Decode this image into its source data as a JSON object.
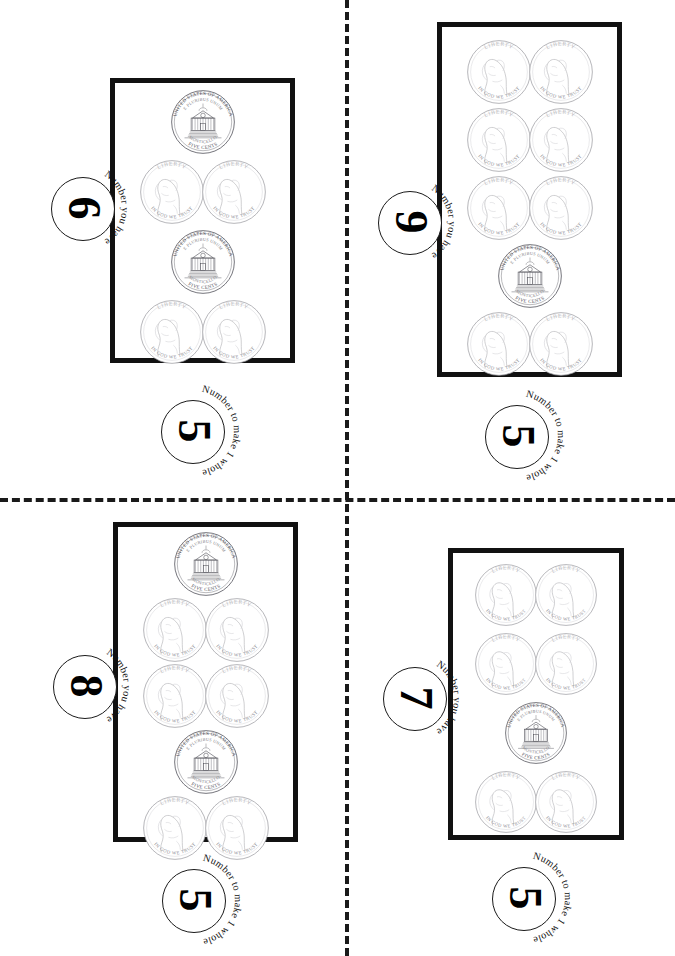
{
  "worksheet": {
    "title": "Coin fraction cards worksheet",
    "page_background": "#ffffff",
    "ink_color": "#111111",
    "cut_lines": {
      "style": "dashed",
      "horizontal_y": 498,
      "vertical_x": 345
    }
  },
  "labels": {
    "have_text": "Number you have",
    "whole_text": "Number to make 1 whole"
  },
  "coin": {
    "type": "nickel",
    "obverse_legend_top": "LIBERTY",
    "obverse_legend_bottom": "IN GOD WE TRUST",
    "reverse_legend_top": "UNITED STATES OF AMERICA",
    "reverse_legend_bottom": "FIVE CENTS",
    "reverse_motto": "E PLURIBUS UNUM",
    "reverse_building": "MONTICELLO"
  },
  "cards": [
    {
      "id": "card-top-left",
      "have_value": "6",
      "whole_value": "5",
      "coin_count": 6,
      "rows": [
        {
          "count": 1,
          "face": "reverse"
        },
        {
          "count": 2,
          "face": "obverse"
        },
        {
          "count": 1,
          "face": "reverse"
        },
        {
          "count": 2,
          "face": "obverse"
        }
      ]
    },
    {
      "id": "card-top-right",
      "have_value": "9",
      "whole_value": "5",
      "coin_count": 9,
      "rows": [
        {
          "count": 2,
          "face": "obverse"
        },
        {
          "count": 2,
          "face": "obverse"
        },
        {
          "count": 2,
          "face": "obverse"
        },
        {
          "count": 1,
          "face": "reverse"
        },
        {
          "count": 2,
          "face": "obverse"
        }
      ]
    },
    {
      "id": "card-bottom-left",
      "have_value": "8",
      "whole_value": "5",
      "coin_count": 8,
      "rows": [
        {
          "count": 1,
          "face": "reverse"
        },
        {
          "count": 2,
          "face": "obverse"
        },
        {
          "count": 2,
          "face": "obverse"
        },
        {
          "count": 1,
          "face": "reverse"
        },
        {
          "count": 2,
          "face": "obverse"
        }
      ]
    },
    {
      "id": "card-bottom-right",
      "have_value": "7",
      "whole_value": "5",
      "coin_count": 7,
      "rows": [
        {
          "count": 2,
          "face": "obverse"
        },
        {
          "count": 2,
          "face": "obverse"
        },
        {
          "count": 1,
          "face": "reverse"
        },
        {
          "count": 2,
          "face": "obverse"
        }
      ]
    }
  ]
}
